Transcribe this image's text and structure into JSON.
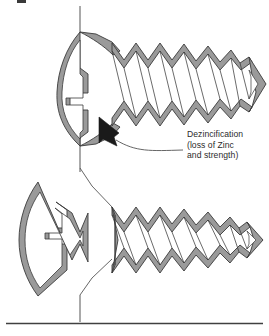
{
  "figure": {
    "name": "dezincification-of-brass-screws-diagram",
    "background_color": "#ffffff",
    "zinc_loss_band_color": "#9a9a9a",
    "core_color": "#ffffff",
    "outline_color": "#3a3a3a",
    "arrow_color": "#1a1a1a",
    "leader_color": "#555555",
    "rule_color": "#404040",
    "text_color": "#2b2b2b"
  },
  "callout": {
    "line1": "Dezincification",
    "line2": "(loss of Zinc",
    "line3": "and strength)",
    "arrow_icon": "solid-triangle-arrowhead",
    "leader_icon": "curved-leader-line"
  },
  "specimens": [
    {
      "id": "intact-screw",
      "label": "intact flat-head wood screw with dezincified surface layer",
      "position": "top",
      "thread_peaks": 7,
      "condition": "intact"
    },
    {
      "id": "fractured-screw",
      "label": "fractured flat-head wood screw separated at shank",
      "position": "bottom",
      "thread_peaks": 7,
      "condition": "fractured",
      "fracture_icon": "v-notch-fracture-surface"
    }
  ],
  "annotations": {
    "axis_icon": "vertical-center-axis-line",
    "break_leader_icon": "break-leader-line",
    "baseline_icon": "horizontal-rule"
  }
}
